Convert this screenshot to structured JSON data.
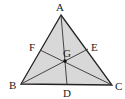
{
  "diagram": {
    "type": "triangle-medians-centroid",
    "fill_color": "#d8d8d8",
    "stroke_color": "#222222",
    "vertices": {
      "A": {
        "label": "A",
        "x": 61,
        "y": 15
      },
      "B": {
        "label": "B",
        "x": 21,
        "y": 84
      },
      "C": {
        "label": "C",
        "x": 112,
        "y": 85
      }
    },
    "points": {
      "D": {
        "label": "D",
        "x": 67,
        "y": 85,
        "on": "BC"
      },
      "E": {
        "label": "E",
        "x": 88,
        "y": 49,
        "on": "AC"
      },
      "F": {
        "label": "F",
        "x": 40,
        "y": 50,
        "on": "AB"
      },
      "G": {
        "label": "G",
        "x": 65,
        "y": 61,
        "role": "intersection"
      }
    },
    "segments": [
      "AB",
      "BC",
      "CA",
      "AD",
      "BE",
      "CF"
    ]
  }
}
